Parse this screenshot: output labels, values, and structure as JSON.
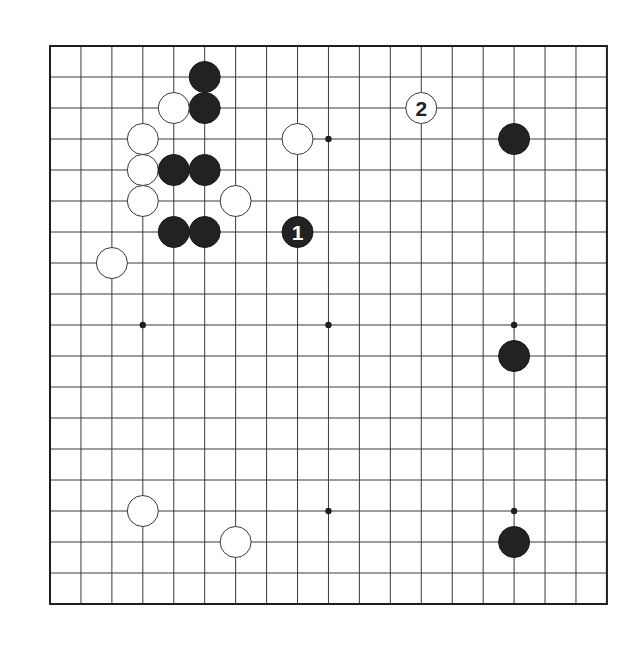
{
  "board": {
    "size": 19,
    "origin_x": 50,
    "origin_y": 46,
    "spacing_x": 30.94,
    "spacing_y": 31.0,
    "stone_radius": 15.5,
    "colors": {
      "background": "#ffffff",
      "line": "#3a3a3a",
      "border": "#1e1e1e",
      "black_stone": "#222222",
      "white_stone": "#ffffff"
    },
    "star_points": [
      [
        3,
        3
      ],
      [
        9,
        3
      ],
      [
        15,
        3
      ],
      [
        3,
        9
      ],
      [
        9,
        9
      ],
      [
        15,
        9
      ],
      [
        3,
        15
      ],
      [
        9,
        15
      ],
      [
        15,
        15
      ]
    ],
    "stones": [
      {
        "color": "black",
        "col": 5,
        "row": 1
      },
      {
        "color": "black",
        "col": 5,
        "row": 2
      },
      {
        "color": "white",
        "col": 4,
        "row": 2
      },
      {
        "color": "white",
        "col": 3,
        "row": 3
      },
      {
        "color": "white",
        "col": 8,
        "row": 3
      },
      {
        "color": "white",
        "col": 3,
        "row": 4
      },
      {
        "color": "black",
        "col": 4,
        "row": 4
      },
      {
        "color": "black",
        "col": 5,
        "row": 4
      },
      {
        "color": "white",
        "col": 3,
        "row": 5
      },
      {
        "color": "white",
        "col": 6,
        "row": 5
      },
      {
        "color": "black",
        "col": 4,
        "row": 6
      },
      {
        "color": "black",
        "col": 5,
        "row": 6
      },
      {
        "color": "white",
        "col": 2,
        "row": 7
      },
      {
        "color": "black",
        "col": 15,
        "row": 3
      },
      {
        "color": "black",
        "col": 15,
        "row": 10
      },
      {
        "color": "white",
        "col": 3,
        "row": 15
      },
      {
        "color": "white",
        "col": 6,
        "row": 16
      },
      {
        "color": "black",
        "col": 15,
        "row": 16
      },
      {
        "color": "black",
        "col": 8,
        "row": 6,
        "label": "1"
      },
      {
        "color": "white",
        "col": 12,
        "row": 2,
        "label": "2"
      }
    ]
  }
}
